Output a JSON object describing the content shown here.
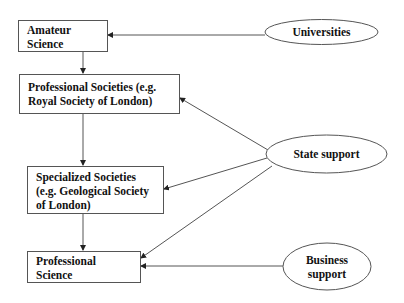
{
  "diagram": {
    "boxes": [
      {
        "id": "amateur-science",
        "label": "Amateur\nScience"
      },
      {
        "id": "professional-societies",
        "label": "Professional Societies (e.g.\nRoyal Society of London)"
      },
      {
        "id": "specialized-societies",
        "label": "Specialized Societies\n(e.g. Geological Society\nof London)"
      },
      {
        "id": "professional-science",
        "label": "Professional\nScience"
      }
    ],
    "ellipses": [
      {
        "id": "universities",
        "label": "Universities"
      },
      {
        "id": "state-support",
        "label": "State support"
      },
      {
        "id": "business-support",
        "label": "Business\nsupport"
      }
    ],
    "edges": [
      {
        "from": "amateur-science",
        "to": "professional-societies"
      },
      {
        "from": "professional-societies",
        "to": "specialized-societies"
      },
      {
        "from": "specialized-societies",
        "to": "professional-science"
      },
      {
        "from": "universities",
        "to": "amateur-science"
      },
      {
        "from": "state-support",
        "to": "professional-societies"
      },
      {
        "from": "state-support",
        "to": "specialized-societies"
      },
      {
        "from": "state-support",
        "to": "professional-science"
      },
      {
        "from": "business-support",
        "to": "professional-science"
      }
    ],
    "colors": {
      "stroke": "#555555",
      "text": "#111111",
      "background": "#ffffff"
    }
  }
}
